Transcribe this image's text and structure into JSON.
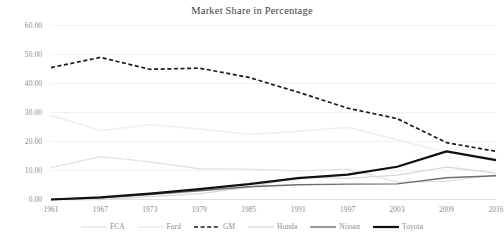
{
  "chart_data": {
    "type": "line",
    "title": "Market Share in Percentage",
    "xlabel": "",
    "ylabel": "",
    "x": [
      1961,
      1967,
      1973,
      1979,
      1985,
      1991,
      1997,
      2003,
      2009,
      2016
    ],
    "categories": [
      "1961",
      "1967",
      "1973",
      "1979",
      "1985",
      "1991",
      "1997",
      "2003",
      "2009",
      "2016"
    ],
    "ylim": [
      0,
      60
    ],
    "ytick_values": [
      0,
      10,
      20,
      30,
      40,
      50,
      60
    ],
    "ytick_labels": [
      "0.00",
      "10.00",
      "20.00",
      "30.00",
      "40.00",
      "50.00",
      "60.00"
    ],
    "grid": true,
    "grid_axis": "y",
    "legend_position": "bottom",
    "series": [
      {
        "name": "FCA",
        "color": "#e2e2e2",
        "width": 1.3,
        "dash": "none",
        "values": [
          11.0,
          14.8,
          13.0,
          10.6,
          10.5,
          9.9,
          10.5,
          6.0,
          6.3,
          8.5
        ]
      },
      {
        "name": "Ford",
        "color": "#efefef",
        "width": 1.6,
        "dash": "none",
        "values": [
          29.0,
          23.8,
          25.8,
          24.3,
          22.4,
          23.5,
          24.9,
          20.6,
          16.3,
          14.0
        ]
      },
      {
        "name": "GM",
        "color": "#1a1a1a",
        "width": 1.7,
        "dash": "4,2.6",
        "values": [
          45.5,
          49.0,
          44.9,
          45.3,
          42.1,
          37.0,
          31.5,
          27.9,
          19.6,
          16.6
        ]
      },
      {
        "name": "Honda",
        "color": "#d8d8d8",
        "width": 1.3,
        "dash": "none",
        "values": [
          0.0,
          0.0,
          1.0,
          2.0,
          4.2,
          7.7,
          7.3,
          8.4,
          11.2,
          9.1
        ]
      },
      {
        "name": "Nissan",
        "color": "#6d6d6d",
        "width": 1.4,
        "dash": "none",
        "values": [
          0.0,
          0.6,
          1.7,
          3.0,
          4.4,
          5.1,
          5.3,
          5.4,
          7.5,
          8.2
        ]
      },
      {
        "name": "Toyota",
        "color": "#111111",
        "width": 2.2,
        "dash": "none",
        "values": [
          0.0,
          0.7,
          2.0,
          3.6,
          5.3,
          7.4,
          8.6,
          11.3,
          16.6,
          13.6
        ]
      }
    ]
  }
}
